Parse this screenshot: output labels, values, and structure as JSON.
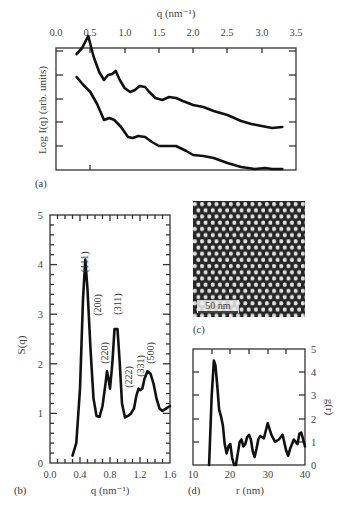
{
  "chart_data": [
    {
      "panel": "(a)",
      "type": "line",
      "title": "",
      "xlabel": "q (nm⁻¹)",
      "ylabel": "Log I(q) (arb. units)",
      "x_axis_position": "top",
      "xlim": [
        0.0,
        3.5
      ],
      "xticks": [
        "0.0",
        "0.5",
        "1.0",
        "1.5",
        "2.0",
        "2.5",
        "3.0",
        "3.5"
      ],
      "yticks_labeled": false,
      "grid": false,
      "series": [
        {
          "name": "upper",
          "x": [
            0.3,
            0.38,
            0.47,
            0.55,
            0.63,
            0.7,
            0.76,
            0.82,
            0.87,
            0.93,
            1.0,
            1.08,
            1.15,
            1.22,
            1.3,
            1.36,
            1.45,
            1.55,
            1.65,
            1.75,
            1.85,
            2.0,
            2.15,
            2.3,
            2.5,
            2.7,
            2.85,
            3.0,
            3.15,
            3.3
          ],
          "y_px": [
            54,
            48,
            36,
            57,
            72,
            80,
            75,
            74,
            71,
            80,
            88,
            92,
            90,
            86,
            87,
            92,
            98,
            100,
            97,
            98,
            101,
            105,
            107,
            111,
            115,
            121,
            124,
            126,
            128,
            127
          ]
        },
        {
          "name": "lower",
          "x": [
            0.3,
            0.4,
            0.5,
            0.6,
            0.7,
            0.78,
            0.85,
            0.95,
            1.05,
            1.12,
            1.2,
            1.3,
            1.4,
            1.5,
            1.6,
            1.75,
            1.9,
            2.0,
            2.15,
            2.3,
            2.5,
            2.7,
            2.9,
            3.05,
            3.15,
            3.3
          ],
          "y_px": [
            77,
            85,
            92,
            104,
            120,
            118,
            120,
            127,
            137,
            138,
            136,
            137,
            142,
            146,
            146,
            146,
            151,
            155,
            156,
            158,
            163,
            167,
            169,
            168,
            171,
            174
          ]
        }
      ]
    },
    {
      "panel": "(b)",
      "type": "line",
      "xlabel": "q (nm⁻¹)",
      "ylabel": "S(q)",
      "xlim": [
        0.0,
        1.6
      ],
      "ylim": [
        0,
        5
      ],
      "xticks": [
        "0.0",
        "0.4",
        "0.8",
        "1.2",
        "1.6"
      ],
      "yticks": [
        "0",
        "1",
        "2",
        "3",
        "4",
        "5"
      ],
      "grid": false,
      "x": [
        0.3,
        0.35,
        0.4,
        0.44,
        0.47,
        0.5,
        0.54,
        0.58,
        0.62,
        0.66,
        0.7,
        0.74,
        0.76,
        0.78,
        0.8,
        0.83,
        0.86,
        0.9,
        0.93,
        0.96,
        1.0,
        1.04,
        1.08,
        1.12,
        1.15,
        1.18,
        1.2,
        1.23,
        1.26,
        1.3,
        1.34,
        1.38,
        1.42,
        1.46,
        1.5,
        1.55,
        1.6
      ],
      "values": [
        0.15,
        0.4,
        1.5,
        3.3,
        4.1,
        3.5,
        2.3,
        1.3,
        0.95,
        0.93,
        1.15,
        1.6,
        1.85,
        1.7,
        1.5,
        2.0,
        2.7,
        2.7,
        2.0,
        1.2,
        0.92,
        0.95,
        1.0,
        1.1,
        1.35,
        1.5,
        1.47,
        1.5,
        1.7,
        1.85,
        1.8,
        1.6,
        1.3,
        1.1,
        1.05,
        1.1,
        1.15
      ],
      "annotations": [
        {
          "label": "(111)",
          "q": 0.47
        },
        {
          "label": "(200)",
          "q": 0.62
        },
        {
          "label": "(220)",
          "q": 0.76
        },
        {
          "label": "(311)",
          "q": 0.9
        },
        {
          "label": "(222)",
          "q": 1.12
        },
        {
          "label": "(331)",
          "q": 1.22
        },
        {
          "label": "(500)",
          "q": 1.33
        }
      ]
    },
    {
      "panel": "(c)",
      "type": "image",
      "description": "Micrograph of hexagonally ordered nanoparticle array",
      "scale_bar": "50 nm"
    },
    {
      "panel": "(d)",
      "type": "line",
      "xlabel": "r (nm)",
      "ylabel": "g(r)",
      "y_axis_position": "right",
      "xlim": [
        10,
        40
      ],
      "ylim": [
        0,
        5
      ],
      "xticks": [
        "10",
        "20",
        "30",
        "40"
      ],
      "yticks": [
        "0",
        "1",
        "2",
        "3",
        "4",
        "5"
      ],
      "grid": false,
      "x": [
        14.3,
        15.0,
        15.6,
        16.0,
        16.5,
        17.0,
        17.5,
        18.0,
        18.5,
        19.0,
        19.5,
        20.0,
        20.5,
        21.0,
        21.5,
        22.0,
        22.5,
        23.0,
        23.5,
        24.0,
        24.5,
        25.0,
        25.5,
        26.0,
        26.5,
        27.0,
        27.5,
        28.0,
        29.0,
        30.0,
        31.0,
        32.0,
        33.0,
        34.0,
        35.0,
        35.5,
        36.0,
        37.0,
        38.0,
        38.5,
        39.0,
        40.0
      ],
      "values": [
        0.0,
        3.0,
        4.5,
        4.3,
        3.4,
        2.4,
        2.1,
        1.7,
        0.9,
        0.5,
        0.8,
        0.9,
        0.3,
        0.0,
        0.0,
        0.5,
        1.0,
        1.1,
        0.8,
        0.9,
        1.2,
        1.3,
        1.1,
        0.6,
        0.35,
        0.7,
        1.1,
        1.25,
        1.15,
        1.8,
        1.3,
        1.0,
        1.1,
        1.3,
        0.6,
        0.4,
        0.7,
        1.1,
        0.9,
        1.35,
        1.4,
        0.8
      ]
    }
  ],
  "labels": {
    "a": {
      "xlabel": "q (nm⁻¹)",
      "ylabel": "Log I(q) (arb. units)",
      "panel": "(a)",
      "xticks": [
        "0.0",
        "0.5",
        "1.0",
        "1.5",
        "2.0",
        "2.5",
        "3.0",
        "3.5"
      ]
    },
    "b": {
      "xlabel": "q (nm⁻¹)",
      "ylabel": "S(q)",
      "panel": "(b)",
      "xticks": [
        "0.0",
        "0.4",
        "0.8",
        "1.2",
        "1.6"
      ],
      "yticks": [
        "0",
        "1",
        "2",
        "3",
        "4",
        "5"
      ],
      "peaks": [
        "(111)",
        "(200)",
        "(220)",
        "(311)",
        "(222)",
        "(331)",
        "(500)"
      ]
    },
    "c": {
      "panel": "(c)",
      "scale_bar": "50 nm"
    },
    "d": {
      "xlabel": "r (nm)",
      "ylabel": "g(r)",
      "panel": "(d)",
      "xticks": [
        "10",
        "20",
        "30",
        "40"
      ],
      "yticks": [
        "0",
        "1",
        "2",
        "3",
        "4",
        "5"
      ]
    }
  }
}
